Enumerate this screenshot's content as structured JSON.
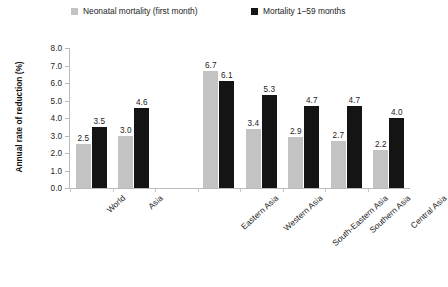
{
  "chart_data": {
    "type": "bar",
    "title": "",
    "xlabel": "",
    "ylabel": "Annual rate of reduction (%)",
    "ylim": [
      0,
      8
    ],
    "ytick_labels": [
      "0.0",
      "1.0",
      "2.0",
      "3.0",
      "4.0",
      "5.0",
      "6.0",
      "7.0",
      "8.0"
    ],
    "ytick_values": [
      0,
      1,
      2,
      3,
      4,
      5,
      6,
      7,
      8
    ],
    "grid": false,
    "legend_position": "top",
    "categories": [
      "World",
      "Asia",
      "",
      "Eastern Asia",
      "Western Asia",
      "South-Eastern Asia",
      "Southern Asia",
      "Central Asia"
    ],
    "series": [
      {
        "name": "Neonatal mortality (first month)",
        "color": "#c3c3c3",
        "values": [
          2.5,
          3.0,
          null,
          6.7,
          3.4,
          2.9,
          2.7,
          2.2
        ],
        "labels": [
          "2.5",
          "3.0",
          "",
          "6.7",
          "3.4",
          "2.9",
          "2.7",
          "2.2"
        ]
      },
      {
        "name": "Mortality 1–59 months",
        "color": "#141414",
        "values": [
          3.5,
          4.6,
          null,
          6.1,
          5.3,
          4.7,
          4.7,
          4.0
        ],
        "labels": [
          "3.5",
          "4.6",
          "",
          "6.1",
          "5.3",
          "4.7",
          "4.7",
          "4.0"
        ]
      }
    ]
  },
  "legend": {
    "items": [
      {
        "label": "Neonatal mortality (first month)",
        "color": "#c3c3c3"
      },
      {
        "label": "Mortality 1–59 months",
        "color": "#141414"
      }
    ]
  }
}
